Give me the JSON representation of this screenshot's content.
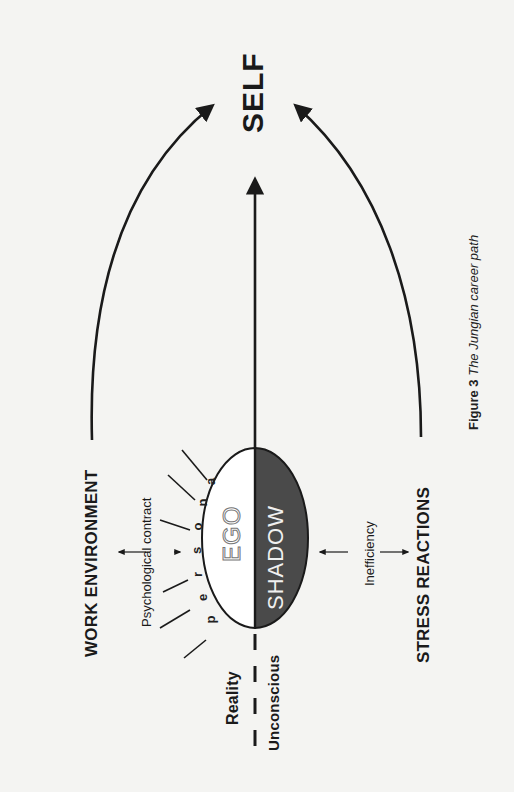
{
  "figure": {
    "caption_number": "Figure 3",
    "caption_title": "The Jungian career path",
    "orientation": "rotated 90° counter-clockwise (landscape figure on portrait page)"
  },
  "nodes": {
    "self": "SELF",
    "work_environment": "WORK ENVIRONMENT",
    "stress_reactions": "STRESS REACTIONS",
    "ego": "EGO",
    "shadow": "SHADOW",
    "psychological_contract": "Psychological contract",
    "inefficiency": "Inefficiency",
    "reality": "Reality",
    "unconscious": "Unconscious"
  },
  "persona_letters": [
    "p",
    "e",
    "r",
    "s",
    "o",
    "n",
    "a"
  ],
  "colors": {
    "background": "#f4f4f2",
    "ink": "#1a1a1a",
    "shadow_fill": "#4a4a4a",
    "ego_fill": "#ffffff"
  }
}
